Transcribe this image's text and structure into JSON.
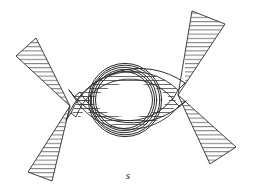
{
  "figure": {
    "domain": "diagram",
    "background_color": "#ffffff",
    "stroke_color": "#2b2b2b",
    "hatch_color": "#3a3a3a",
    "canvas": {
      "width": 253,
      "height": 193
    },
    "labels": [
      {
        "id": "label-s",
        "text": "s",
        "x": 128,
        "y": 176,
        "style": "italic"
      }
    ],
    "apexes": [
      {
        "id": "apex-left",
        "x": 70,
        "y": 106
      },
      {
        "id": "apex-right",
        "x": 178,
        "y": 95
      }
    ],
    "center": {
      "cx": 124,
      "cy": 100
    },
    "concentric_circles": {
      "count": 5,
      "radii": [
        28.5,
        30.5,
        32.5,
        34.5,
        36.5
      ]
    },
    "lune_bands": [
      {
        "id": "lune-top",
        "position": "top",
        "hatched": true,
        "hatch_spacing": 4.0,
        "hatch_angle_deg": 0
      },
      {
        "id": "lune-bottom",
        "position": "bottom",
        "hatched": true,
        "hatch_spacing": 4.0,
        "hatch_angle_deg": 0
      }
    ],
    "outer_arcs": [
      {
        "id": "outer-arc-top",
        "position": "top",
        "hatched": false
      },
      {
        "id": "outer-arc-bottom",
        "position": "bottom",
        "hatched": false
      }
    ],
    "wedges": [
      {
        "id": "wedge-upper-left",
        "apex": "apex-left",
        "hatched": true,
        "hatch_spacing": 4.2,
        "points": "70,106 16,56 36,38"
      },
      {
        "id": "wedge-lower-left",
        "apex": "apex-left",
        "hatched": true,
        "hatch_spacing": 4.2,
        "points": "70,106 28,172 52,181"
      },
      {
        "id": "wedge-upper-right",
        "apex": "apex-right",
        "hatched": true,
        "hatch_spacing": 4.2,
        "points": "178,95 192,11 225,24"
      },
      {
        "id": "wedge-lower-right",
        "apex": "apex-right",
        "hatched": true,
        "hatch_spacing": 4.2,
        "points": "178,95 236,147 210,164"
      }
    ]
  }
}
